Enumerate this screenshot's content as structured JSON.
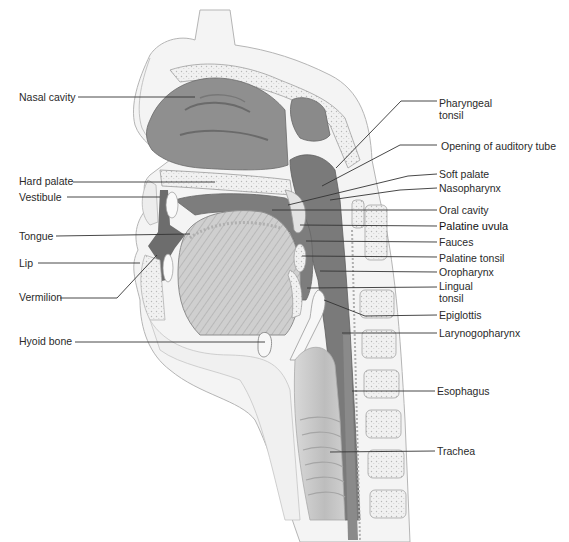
{
  "figure": {
    "colors": {
      "background": "#ffffff",
      "cavity_dark": "#6f6f6f",
      "cavity_mid": "#8a8a8a",
      "tissue_light": "#e4e4e4",
      "bone": "#f2f2f2",
      "outline": "#9a9a9a",
      "leader": "#333333",
      "text": "#2a2a2a"
    }
  },
  "labels_left": [
    {
      "id": "nasal-cavity",
      "text": "Nasal cavity",
      "x": 19,
      "y": 91,
      "line": [
        [
          78,
          97
        ],
        [
          195,
          97
        ]
      ]
    },
    {
      "id": "hard-palate",
      "text": "Hard palate",
      "x": 19,
      "y": 175,
      "line": [
        [
          73,
          182
        ],
        [
          215,
          182
        ]
      ]
    },
    {
      "id": "vestibule",
      "text": "Vestibule",
      "x": 19,
      "y": 191,
      "line": [
        [
          67,
          197
        ],
        [
          160,
          197
        ]
      ]
    },
    {
      "id": "tongue",
      "text": "Tongue",
      "x": 19,
      "y": 230,
      "line": [
        [
          56,
          236
        ],
        [
          190,
          234
        ]
      ]
    },
    {
      "id": "lip",
      "text": "Lip",
      "x": 19,
      "y": 257,
      "line": [
        [
          38,
          263
        ],
        [
          140,
          263
        ]
      ]
    },
    {
      "id": "vermilion",
      "text": "Vermilion",
      "x": 19,
      "y": 291,
      "line": [
        [
          60,
          298
        ],
        [
          117,
          298
        ],
        [
          157,
          255
        ]
      ]
    },
    {
      "id": "hyoid-bone",
      "text": "Hyoid bone",
      "x": 19,
      "y": 335,
      "line": [
        [
          75,
          342
        ],
        [
          265,
          342
        ]
      ]
    }
  ],
  "labels_right": [
    {
      "id": "pharyngeal-tonsil",
      "text": "Pharyngeal tonsil",
      "x": 439,
      "y": 97,
      "two_line": true,
      "line": [
        [
          437,
          101
        ],
        [
          401,
          101
        ],
        [
          336,
          168
        ]
      ]
    },
    {
      "id": "opening-auditory-tube",
      "text": "Opening of auditory tube",
      "x": 441,
      "y": 140,
      "line": [
        [
          437,
          145
        ],
        [
          400,
          145
        ],
        [
          322,
          186
        ]
      ]
    },
    {
      "id": "soft-palate",
      "text": "Soft palate",
      "x": 439,
      "y": 168,
      "line": [
        [
          437,
          174
        ],
        [
          408,
          176
        ],
        [
          288,
          205
        ]
      ]
    },
    {
      "id": "nasopharynx",
      "text": "Nasopharynx",
      "x": 439,
      "y": 182,
      "line": [
        [
          437,
          188
        ],
        [
          400,
          190
        ],
        [
          330,
          200
        ]
      ]
    },
    {
      "id": "oral-cavity",
      "text": "Oral cavity",
      "x": 439,
      "y": 204,
      "line": [
        [
          437,
          210
        ],
        [
          272,
          210
        ]
      ]
    },
    {
      "id": "palatine-uvula",
      "text": "Palatine uvula",
      "x": 439,
      "y": 220,
      "strong": true,
      "line": [
        [
          437,
          226
        ],
        [
          300,
          225
        ]
      ]
    },
    {
      "id": "fauces",
      "text": "Fauces",
      "x": 439,
      "y": 236,
      "line": [
        [
          437,
          242
        ],
        [
          306,
          241
        ]
      ]
    },
    {
      "id": "palatine-tonsil",
      "text": "Palatine tonsil",
      "x": 439,
      "y": 252,
      "line": [
        [
          437,
          257
        ],
        [
          302,
          256
        ]
      ]
    },
    {
      "id": "oropharynx",
      "text": "Oropharynx",
      "x": 439,
      "y": 266,
      "line": [
        [
          437,
          272
        ],
        [
          320,
          271
        ]
      ]
    },
    {
      "id": "lingual-tonsil",
      "text": "Lingual tonsil",
      "x": 439,
      "y": 280,
      "two_line": true,
      "line": [
        [
          437,
          287
        ],
        [
          307,
          288
        ]
      ]
    },
    {
      "id": "epiglottis",
      "text": "Epiglottis",
      "x": 439,
      "y": 309,
      "line": [
        [
          437,
          315
        ],
        [
          365,
          316
        ],
        [
          324,
          300
        ]
      ]
    },
    {
      "id": "laryngopharynx",
      "text": "Larynogopharynx",
      "x": 439,
      "y": 327,
      "line": [
        [
          437,
          333
        ],
        [
          342,
          333
        ]
      ]
    },
    {
      "id": "esophagus",
      "text": "Esophagus",
      "x": 437,
      "y": 385,
      "line": [
        [
          435,
          391
        ],
        [
          352,
          391
        ]
      ]
    },
    {
      "id": "trachea",
      "text": "Trachea",
      "x": 437,
      "y": 445,
      "line": [
        [
          435,
          451
        ],
        [
          330,
          452
        ]
      ]
    }
  ]
}
